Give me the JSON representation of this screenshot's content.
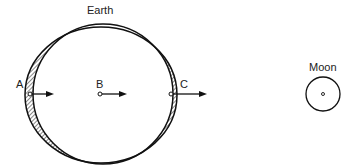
{
  "diagram": {
    "earth_label": "Earth",
    "moon_label": "Moon",
    "points": [
      {
        "id": "A",
        "label": "A"
      },
      {
        "id": "B",
        "label": "B"
      },
      {
        "id": "C",
        "label": "C"
      }
    ],
    "colors": {
      "stroke": "#111111",
      "background": "#ffffff"
    }
  }
}
